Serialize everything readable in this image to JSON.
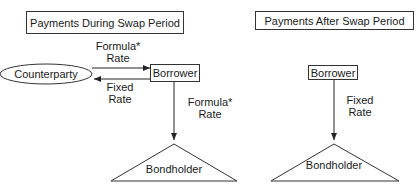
{
  "left_panel": {
    "title": "Payments During Swap Period",
    "counterparty": "Counterparty",
    "borrower": "Borrower",
    "bondholder": "Bondholder",
    "arrow_to_borrower": {
      "line1": "Formula*",
      "line2": "Rate"
    },
    "arrow_to_counterparty": {
      "line1": "Fixed",
      "line2": "Rate"
    },
    "arrow_to_bondholder": {
      "line1": "Formula*",
      "line2": "Rate"
    }
  },
  "right_panel": {
    "title": "Payments After Swap Period",
    "borrower": "Borrower",
    "bondholder": "Bondholder",
    "arrow_to_bondholder": {
      "line1": "Fixed",
      "line2": "Rate"
    }
  }
}
